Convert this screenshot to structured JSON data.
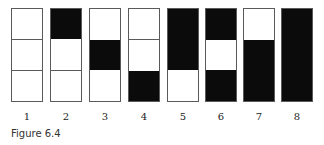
{
  "figure": {
    "caption": "Figure 6.4",
    "colors": {
      "filled": "#0b0b0b",
      "empty": "#ffffff",
      "border": "#5a5a5a"
    },
    "columns": [
      {
        "label": "1",
        "cells": [
          "white",
          "white",
          "white"
        ]
      },
      {
        "label": "2",
        "cells": [
          "black",
          "white",
          "white"
        ]
      },
      {
        "label": "3",
        "cells": [
          "white",
          "black",
          "white"
        ]
      },
      {
        "label": "4",
        "cells": [
          "white",
          "white",
          "black"
        ]
      },
      {
        "label": "5",
        "cells": [
          "black",
          "black",
          "white"
        ]
      },
      {
        "label": "6",
        "cells": [
          "black",
          "white",
          "black"
        ]
      },
      {
        "label": "7",
        "cells": [
          "white",
          "black",
          "black"
        ]
      },
      {
        "label": "8",
        "cells": [
          "black",
          "black",
          "black"
        ]
      }
    ]
  }
}
